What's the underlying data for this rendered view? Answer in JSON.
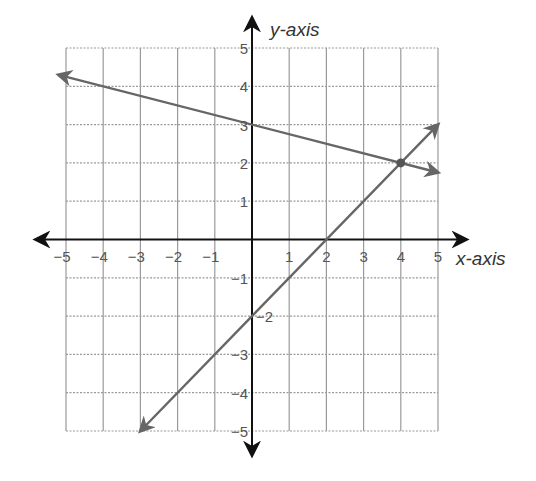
{
  "chart_data": {
    "type": "line",
    "title": "",
    "xlabel": "x-axis",
    "ylabel": "y-axis",
    "xlim": [
      -5,
      5
    ],
    "ylim": [
      -5,
      5
    ],
    "grid": true,
    "legend": null,
    "x_ticks": [
      "-5",
      "-4",
      "-3",
      "-2",
      "-1",
      "1",
      "2",
      "3",
      "4",
      "5"
    ],
    "y_ticks": [
      "5",
      "4",
      "3",
      "2",
      "1",
      "-1",
      "-2",
      "-3",
      "-4",
      "-5"
    ],
    "series": [
      {
        "name": "line-1",
        "equation": "y = -1/4 x + 3",
        "points": [
          [
            -5.2,
            4.3
          ],
          [
            0,
            3
          ],
          [
            4,
            2
          ],
          [
            5,
            1.75
          ]
        ],
        "arrows": "both",
        "color": "#666666"
      },
      {
        "name": "line-2",
        "equation": "y = x - 2",
        "points": [
          [
            -3,
            -5
          ],
          [
            0,
            -2
          ],
          [
            2,
            0
          ],
          [
            4,
            2
          ],
          [
            5,
            3
          ]
        ],
        "arrows": "both",
        "color": "#666666"
      }
    ],
    "annotations": [
      {
        "type": "point",
        "x": 4,
        "y": 2,
        "label": "intersection"
      }
    ]
  },
  "colors": {
    "axis": "#111111",
    "grid": "#9a9a9a",
    "line": "#666666",
    "text": "#555555"
  }
}
